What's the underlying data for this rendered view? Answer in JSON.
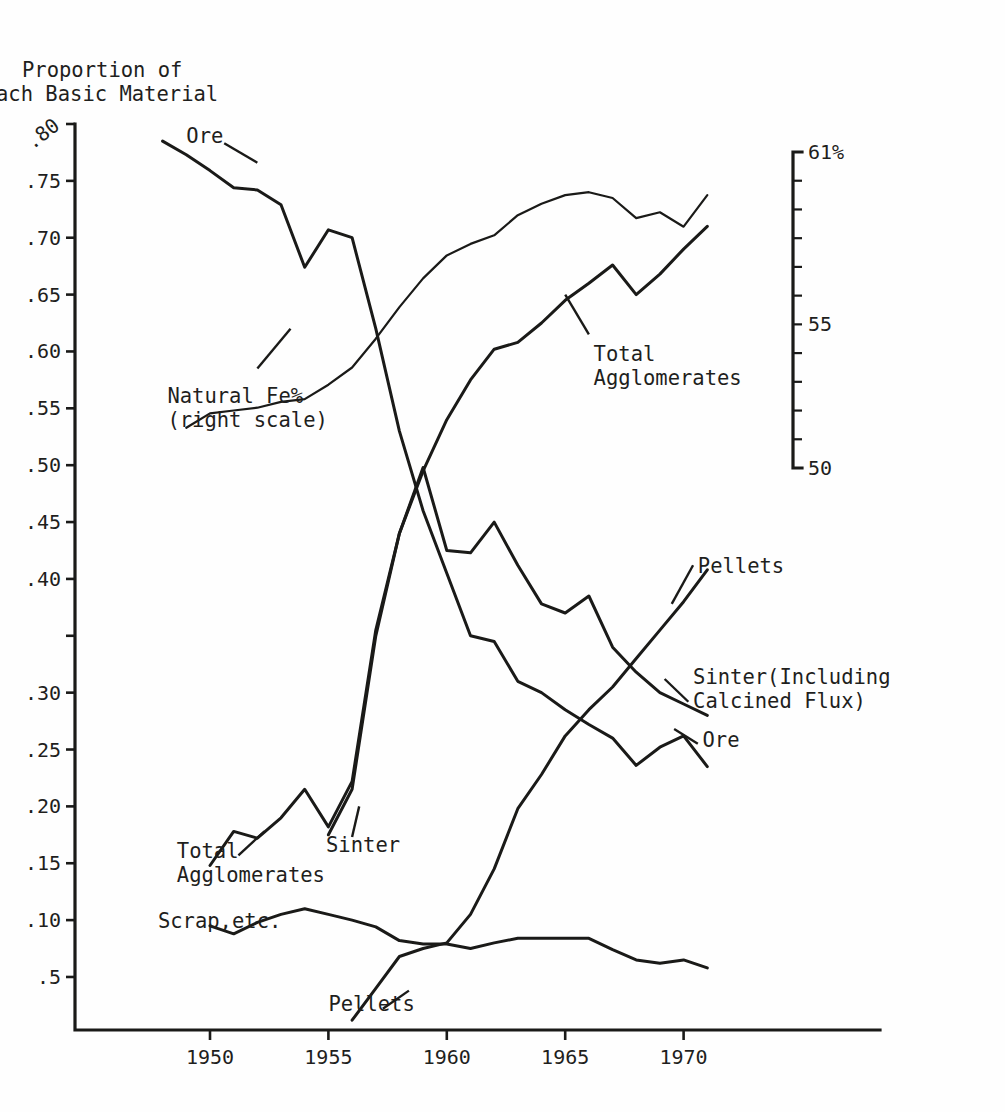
{
  "chart_data": {
    "type": "line",
    "title_line1": "Proportion of",
    "title_line2": "ach Basic Material",
    "xlabel": "",
    "ylabel": "Proportion of Each Basic Material",
    "y2label": "Natural Fe%",
    "xlim": [
      1947.5,
      1972.0
    ],
    "ylim": [
      0.0,
      0.82
    ],
    "y2lim": [
      50,
      61
    ],
    "grid": false,
    "legend": "inline-annotations",
    "x_ticks": [
      1950,
      1955,
      1960,
      1965,
      1970
    ],
    "x_tick_labels": [
      "1950",
      "1955",
      "1960",
      "1965",
      "1970"
    ],
    "y_ticks": [
      0.8,
      0.75,
      0.7,
      0.65,
      0.6,
      0.55,
      0.5,
      0.45,
      0.4,
      0.35,
      0.3,
      0.25,
      0.2,
      0.15,
      0.1,
      0.05
    ],
    "y_tick_labels": [
      ".80",
      ".75",
      ".70",
      ".65",
      ".60",
      ".55",
      ".50",
      ".45",
      ".40",
      "",
      ".30",
      ".25",
      ".20",
      ".15",
      ".10",
      ".5"
    ],
    "y2_ticks": [
      61,
      60,
      59,
      58,
      57,
      56,
      55,
      54,
      53,
      52,
      51,
      50
    ],
    "y2_tick_labels": [
      "61%",
      "",
      "",
      "",
      "",
      "",
      "55",
      "",
      "",
      "",
      "",
      "50"
    ],
    "series": [
      {
        "name": "Ore",
        "axis": "left",
        "x": [
          1948,
          1949,
          1950,
          1951,
          1952,
          1953,
          1954,
          1955,
          1956,
          1957,
          1958,
          1959,
          1960,
          1961,
          1962,
          1963,
          1964,
          1965,
          1966,
          1967,
          1968,
          1969,
          1970,
          1971
        ],
        "values": [
          0.785,
          0.773,
          0.759,
          0.744,
          0.742,
          0.729,
          0.674,
          0.707,
          0.7,
          0.62,
          0.53,
          0.46,
          0.405,
          0.35,
          0.345,
          0.31,
          0.3,
          0.285,
          0.272,
          0.26,
          0.236,
          0.252,
          0.262,
          0.235
        ]
      },
      {
        "name": "Natural Fe%",
        "axis": "right",
        "x": [
          1949,
          1950,
          1951,
          1952,
          1953,
          1954,
          1955,
          1956,
          1957,
          1958,
          1959,
          1960,
          1961,
          1962,
          1963,
          1964,
          1965,
          1966,
          1967,
          1968,
          1969,
          1970,
          1971
        ],
        "values": [
          51.4,
          51.9,
          52.0,
          52.1,
          52.3,
          52.4,
          52.9,
          53.5,
          54.5,
          55.6,
          56.6,
          57.4,
          57.8,
          58.1,
          58.8,
          59.2,
          59.5,
          59.6,
          59.4,
          58.7,
          58.9,
          58.4,
          59.5
        ]
      },
      {
        "name": "Total Agglomerates",
        "axis": "left",
        "x": [
          1950,
          1951,
          1952,
          1953,
          1954,
          1955,
          1956,
          1957,
          1958,
          1959,
          1960,
          1961,
          1962,
          1963,
          1964,
          1965,
          1966,
          1967,
          1968,
          1969,
          1970,
          1971
        ],
        "values": [
          0.148,
          0.178,
          0.172,
          0.19,
          0.215,
          0.182,
          0.222,
          0.355,
          0.44,
          0.495,
          0.54,
          0.575,
          0.602,
          0.608,
          0.625,
          0.645,
          0.66,
          0.676,
          0.65,
          0.668,
          0.69,
          0.71
        ]
      },
      {
        "name": "Sinter (Including Calcined Flux)",
        "axis": "left",
        "x": [
          1955,
          1956,
          1957,
          1958,
          1959,
          1960,
          1961,
          1962,
          1963,
          1964,
          1965,
          1966,
          1967,
          1968,
          1969,
          1970,
          1971
        ],
        "values": [
          0.175,
          0.215,
          0.35,
          0.44,
          0.498,
          0.425,
          0.423,
          0.45,
          0.412,
          0.378,
          0.37,
          0.385,
          0.34,
          0.318,
          0.3,
          0.29,
          0.28
        ]
      },
      {
        "name": "Pellets",
        "axis": "left",
        "x": [
          1956,
          1957,
          1958,
          1959,
          1960,
          1961,
          1962,
          1963,
          1964,
          1965,
          1966,
          1967,
          1968,
          1969,
          1970,
          1971
        ],
        "values": [
          0.012,
          0.04,
          0.068,
          0.075,
          0.08,
          0.105,
          0.145,
          0.198,
          0.228,
          0.262,
          0.285,
          0.305,
          0.33,
          0.355,
          0.38,
          0.408
        ]
      },
      {
        "name": "Scrap, etc.",
        "axis": "left",
        "x": [
          1950,
          1951,
          1952,
          1953,
          1954,
          1955,
          1956,
          1957,
          1958,
          1959,
          1960,
          1961,
          1962,
          1963,
          1964,
          1965,
          1966,
          1967,
          1968,
          1969,
          1970,
          1971
        ],
        "values": [
          0.095,
          0.088,
          0.098,
          0.105,
          0.11,
          0.105,
          0.1,
          0.094,
          0.082,
          0.079,
          0.079,
          0.075,
          0.08,
          0.084,
          0.084,
          0.084,
          0.084,
          0.074,
          0.065,
          0.062,
          0.065,
          0.058
        ]
      }
    ],
    "annotations": [
      {
        "id": "ore-left",
        "text": "Ore",
        "x": 1949.0,
        "y": 0.783
      },
      {
        "id": "natural-fe",
        "text_line1": "Natural Fe%",
        "text_line2": "(right scale)",
        "x": 1948.2,
        "y": 0.555
      },
      {
        "id": "total-agg-left",
        "text_line1": "Total",
        "text_line2": "Agglomerates",
        "x": 1948.6,
        "y": 0.155
      },
      {
        "id": "scrap",
        "text": "Scrap,etc.",
        "x": 1947.8,
        "y": 0.093
      },
      {
        "id": "sinter-bottom",
        "text": "Sinter",
        "x": 1954.9,
        "y": 0.16
      },
      {
        "id": "pellets-bottom",
        "text": "Pellets",
        "x": 1955.0,
        "y": 0.02
      },
      {
        "id": "total-agg-right",
        "text_line1": "Total",
        "text_line2": "Agglomerates",
        "x": 1966.2,
        "y": 0.592
      },
      {
        "id": "pellets-right",
        "text": "Pellets",
        "x": 1970.6,
        "y": 0.405
      },
      {
        "id": "sinter-right",
        "text_line1": "Sinter(Including",
        "text_line2": "Calcined Flux)",
        "x": 1970.4,
        "y": 0.308
      },
      {
        "id": "ore-right",
        "text": "Ore",
        "x": 1970.8,
        "y": 0.252
      }
    ],
    "colors": {
      "ink": "#1a1a18",
      "background": "#fefefe"
    }
  },
  "axis_titles": {
    "y_rot_top": ".80"
  }
}
